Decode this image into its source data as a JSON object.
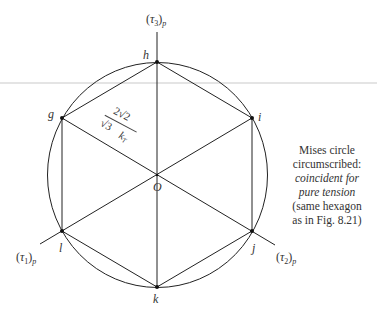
{
  "figure": {
    "axes": {
      "tau3": {
        "symbol": "τ",
        "index": "3",
        "subscript": "p"
      },
      "tau1": {
        "symbol": "τ",
        "index": "1",
        "subscript": "p"
      },
      "tau2": {
        "symbol": "τ",
        "index": "2",
        "subscript": "p"
      }
    },
    "vertices": {
      "h": "h",
      "i": "i",
      "j": "j",
      "k": "k",
      "l": "l",
      "g": "g"
    },
    "origin": "O",
    "formula": {
      "numerator": "2√2",
      "denominator": "√3",
      "variable": "k",
      "variable_subscript": "T"
    },
    "caption": {
      "line1": "Mises circle",
      "line2": "circumscribed:",
      "line3": "coincident for",
      "line4": "pure tension",
      "line5": "(same hexagon",
      "line6": "as in Fig. 8.21)"
    },
    "geometry": {
      "center": [
        157,
        175
      ],
      "circle_radius": 112,
      "stroke_color": "#222222",
      "divider_color": "#bbbbbb"
    }
  }
}
